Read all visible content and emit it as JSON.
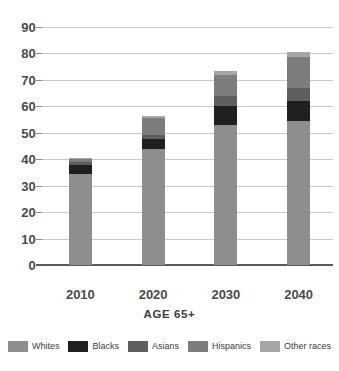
{
  "chart_data": {
    "type": "bar",
    "title": "",
    "xlabel": "AGE 65+",
    "ylabel": "",
    "categories": [
      "2010",
      "2020",
      "2030",
      "2040"
    ],
    "ylim": [
      0,
      90
    ],
    "ytick_step": 10,
    "yticks": [
      "90",
      "80",
      "70",
      "60",
      "50",
      "40",
      "30",
      "20",
      "10",
      "0"
    ],
    "grid": true,
    "stacked": true,
    "legend_position": "bottom",
    "series": [
      {
        "name": "Whites",
        "color": "#8e8e8e",
        "values": [
          34.5,
          44.0,
          53.0,
          54.5
        ]
      },
      {
        "name": "Blacks",
        "color": "#211f20",
        "values": [
          3.5,
          3.5,
          7.0,
          7.5
        ]
      },
      {
        "name": "Asians",
        "color": "#5e5e5e",
        "values": [
          1.0,
          1.5,
          4.0,
          5.0
        ]
      },
      {
        "name": "Hispanics",
        "color": "#7d7d7d",
        "values": [
          1.0,
          6.5,
          8.0,
          11.5
        ]
      },
      {
        "name": "Other races",
        "color": "#a6a6a6",
        "values": [
          0.5,
          1.0,
          1.5,
          2.0
        ]
      }
    ],
    "totals": [
      40.5,
      56.5,
      73.5,
      80.5
    ]
  },
  "legend": {
    "items": [
      {
        "label": "Whites"
      },
      {
        "label": "Blacks"
      },
      {
        "label": "Asians"
      },
      {
        "label": "Hispanics"
      },
      {
        "label": "Other races"
      }
    ]
  },
  "axis": {
    "x_title": "AGE 65+"
  }
}
